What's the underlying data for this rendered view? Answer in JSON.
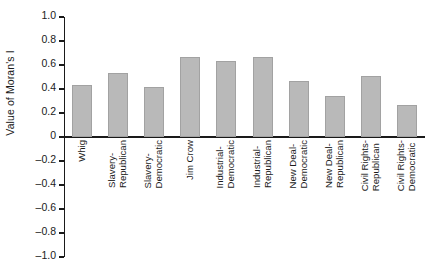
{
  "chart_data": {
    "type": "bar",
    "title": "",
    "xlabel": "",
    "ylabel": "Value of Moran's I",
    "ylim": [
      -1.0,
      1.0
    ],
    "grid": false,
    "legend": null,
    "bar_color": "#b9b9b9",
    "bar_edge_color": "#a2a2a2",
    "axis_color": "#1a1a1a",
    "categories": [
      "Whig",
      "Slavery-Republican",
      "Slavery-Democratic",
      "Jim Crow",
      "Industrial-Democratic",
      "Industrial-Republican",
      "New Deal-Democratic",
      "New Deal-Republican",
      "Civil Rights-Republican",
      "Civil Rights-Democratic"
    ],
    "category_lines": [
      [
        "Whig",
        ""
      ],
      [
        "Slavery-",
        "Republican"
      ],
      [
        "Slavery-",
        "Democratic"
      ],
      [
        "Jim Crow",
        ""
      ],
      [
        "Industrial-",
        "Democratic"
      ],
      [
        "Industrial-",
        "Republican"
      ],
      [
        "New Deal-",
        "Democratic"
      ],
      [
        "New Deal-",
        "Republican"
      ],
      [
        "Civil Rights-",
        "Republican"
      ],
      [
        "Civil Rights-",
        "Democratic"
      ]
    ],
    "values": [
      0.43,
      0.53,
      0.42,
      0.67,
      0.63,
      0.67,
      0.47,
      0.34,
      0.51,
      0.27
    ],
    "ytick_values": [
      1.0,
      0.8,
      0.6,
      0.4,
      0.2,
      0,
      -0.2,
      -0.4,
      -0.6,
      -0.8,
      -1.0
    ],
    "ytick_labels": [
      "1.0",
      "0.8",
      "0.6",
      "0.4",
      "0.2",
      "0",
      "–0.2",
      "–0.4",
      "–0.6",
      "–0.8",
      "–1.0"
    ]
  }
}
